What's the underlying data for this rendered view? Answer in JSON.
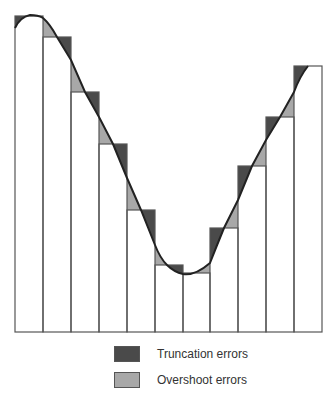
{
  "figure": {
    "title": "",
    "num_bars": 11,
    "colors": {
      "truncation": "#4a4a4a",
      "overshoot": "#a8a8a8",
      "bar_fill": "#ffffff",
      "bar_stroke": "#555555",
      "curve": "#222222"
    }
  },
  "legend": {
    "items": [
      {
        "label": "Truncation errors",
        "color": "#4a4a4a"
      },
      {
        "label": "Overshoot errors",
        "color": "#a8a8a8"
      }
    ]
  }
}
